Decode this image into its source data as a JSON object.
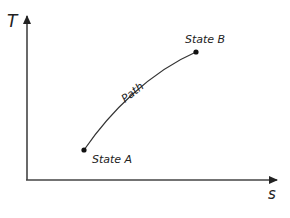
{
  "diagram": {
    "type": "T-s diagram",
    "axes": {
      "y_label": "T",
      "x_label": "s"
    },
    "points": [
      {
        "label": "State A",
        "x": 84,
        "y": 150
      },
      {
        "label": "State B",
        "x": 196,
        "y": 52
      }
    ],
    "path_label": "Path",
    "colors": {
      "line": "#222222",
      "axis": "#333333",
      "text": "#222222"
    }
  }
}
